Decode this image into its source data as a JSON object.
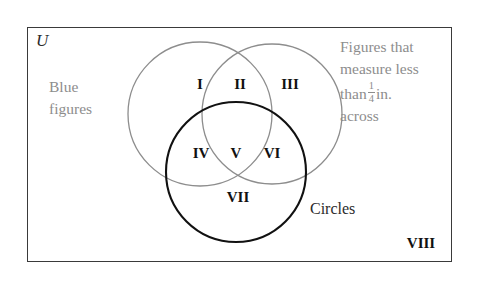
{
  "diagram": {
    "universe_symbol": "U",
    "border_color": "#3a3a3a",
    "outer_label_color": "#8d8d8d",
    "set_labels": {
      "left": {
        "line1": "Blue",
        "line2": "figures",
        "circle_color": "#8d8d8d"
      },
      "right": {
        "line1": "Figures that",
        "line2": "measure less",
        "line3_prefix": "than",
        "fraction_numerator": "1",
        "fraction_denominator": "4",
        "line3_suffix": "in.",
        "line4": "across",
        "circle_color": "#8d8d8d"
      },
      "bottom": {
        "text": "Circles",
        "circle_color": "#111111"
      }
    },
    "regions": [
      {
        "id": "I",
        "label": "I",
        "x": 200,
        "y": 84,
        "description": "blue figures only"
      },
      {
        "id": "II",
        "label": "II",
        "x": 240,
        "y": 84,
        "description": "blue and small"
      },
      {
        "id": "III",
        "label": "III",
        "x": 290,
        "y": 84,
        "description": "small figures only"
      },
      {
        "id": "IV",
        "label": "IV",
        "x": 201,
        "y": 153,
        "description": "blue and circles"
      },
      {
        "id": "V",
        "label": "V",
        "x": 236,
        "y": 153,
        "description": "blue, small and circles"
      },
      {
        "id": "VI",
        "label": "VI",
        "x": 272,
        "y": 153,
        "description": "small and circles"
      },
      {
        "id": "VII",
        "label": "VII",
        "x": 238,
        "y": 197,
        "description": "circles only"
      },
      {
        "id": "VIII",
        "label": "VIII",
        "x": 421,
        "y": 243,
        "description": "outside all sets"
      }
    ]
  }
}
